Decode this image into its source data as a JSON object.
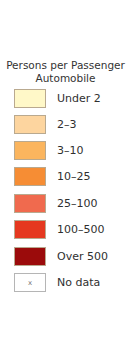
{
  "legend": {
    "title_line1": "Persons per Passenger",
    "title_line2": "Automobile",
    "items": [
      {
        "label": "Under 2",
        "color": "#fff8c8",
        "symbol": ""
      },
      {
        "label": "2–3",
        "color": "#fdd59f",
        "symbol": ""
      },
      {
        "label": "3–10",
        "color": "#fbb55e",
        "symbol": ""
      },
      {
        "label": "10–25",
        "color": "#f68d34",
        "symbol": ""
      },
      {
        "label": "25–100",
        "color": "#f06a4e",
        "symbol": ""
      },
      {
        "label": "100–500",
        "color": "#e5381f",
        "symbol": ""
      },
      {
        "label": "Over 500",
        "color": "#9b0b0b",
        "symbol": ""
      },
      {
        "label": "No data",
        "color": "#ffffff",
        "symbol": "x"
      }
    ]
  }
}
